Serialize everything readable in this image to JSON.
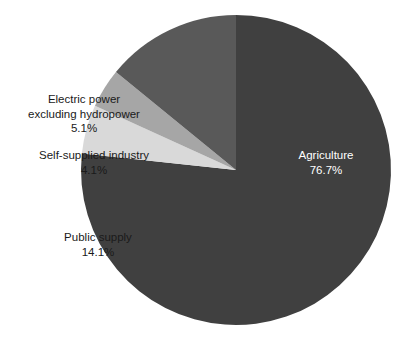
{
  "chart_data": {
    "type": "pie",
    "title": "",
    "subtitle": "",
    "xlabel": "",
    "ylabel": "",
    "legend_position": "none",
    "grid": false,
    "labels_inside": [
      "Agriculture"
    ],
    "categories": [
      "Agriculture",
      "Electric power excluding hydropower",
      "Self-supplied industry",
      "Public supply"
    ],
    "values": [
      76.7,
      5.1,
      4.1,
      14.1
    ],
    "value_unit": "%",
    "slices": [
      {
        "name": "Agriculture",
        "label_line1": "Agriculture",
        "label_line2": "76.7%",
        "value": 76.7,
        "color": "#404040",
        "text_color": "#ffffff",
        "start_angle_deg": 0,
        "end_angle_deg": 276.12
      },
      {
        "name": "Electric power excluding hydropower",
        "label_line1": "Electric power",
        "label_line2": "excluding hydropower",
        "label_line3": "5.1%",
        "value": 5.1,
        "color": "#d9d9d9",
        "text_color": "#1a1a1a",
        "start_angle_deg": 276.12,
        "end_angle_deg": 294.48
      },
      {
        "name": "Self-supplied industry",
        "label_line1": "Self-supplied industry",
        "label_line2": "4.1%",
        "value": 4.1,
        "color": "#a6a6a6",
        "text_color": "#1a1a1a",
        "start_angle_deg": 294.48,
        "end_angle_deg": 309.24
      },
      {
        "name": "Public supply",
        "label_line1": "Public supply",
        "label_line2": "14.1%",
        "value": 14.1,
        "color": "#595959",
        "text_color": "#1a1a1a",
        "start_angle_deg": 309.24,
        "end_angle_deg": 360
      }
    ]
  },
  "labels": {
    "electric": {
      "line1": "Electric power",
      "line2": "excluding hydropower",
      "line3": "5.1%"
    },
    "industry": {
      "line1": "Self-supplied industry",
      "line2": "4.1%"
    },
    "public": {
      "line1": "Public supply",
      "line2": "14.1%"
    },
    "agriculture": {
      "line1": "Agriculture",
      "line2": "76.7%"
    }
  },
  "geometry": {
    "center_x": 236,
    "center_y": 170,
    "radius": 155
  },
  "colors": {
    "background": "#ffffff",
    "agriculture": "#404040",
    "electric_power": "#d9d9d9",
    "self_supplied_industry": "#a6a6a6",
    "public_supply": "#595959"
  }
}
